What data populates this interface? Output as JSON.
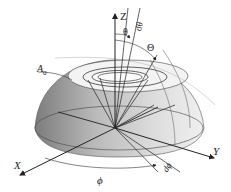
{
  "diagram": {
    "type": "hemisphere-coordinate-diagram",
    "labels": {
      "z_axis": "Z",
      "x_axis": "X",
      "y_axis": "Y",
      "theta": "θ",
      "d_theta": "dθ",
      "big_theta": "Θ",
      "area": "A",
      "area_sub": "0",
      "phi": "ϕ",
      "d_phi": "dϕ"
    },
    "colors": {
      "line": "#222222",
      "shade_dark": "#8a8a8a",
      "shade_light": "#e6e6e6",
      "cap": "#f2f2f2"
    }
  }
}
